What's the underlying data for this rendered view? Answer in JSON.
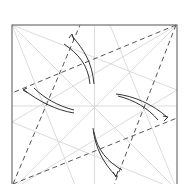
{
  "diagram": {
    "type": "origami-crease-pattern",
    "colors": {
      "background": "#ffffff",
      "border": "#707070",
      "crease": "#cfcfcf",
      "valley_fold": "#555555",
      "arrow": "#333333"
    },
    "square": {
      "x": 12,
      "y": 25,
      "size": 165
    },
    "valley_folds": [
      {
        "from": [
          176,
          25
        ],
        "to": [
          12,
          93
        ]
      },
      {
        "from": [
          176,
          25
        ],
        "to": [
          113,
          190
        ]
      },
      {
        "from": [
          13,
          184
        ],
        "to": [
          80,
          25
        ]
      },
      {
        "from": [
          13,
          184
        ],
        "to": [
          177,
          118
        ]
      }
    ],
    "arrows": [
      {
        "name": "arrow-top",
        "direction": "up-left"
      },
      {
        "name": "arrow-left",
        "direction": "left"
      },
      {
        "name": "arrow-right",
        "direction": "right-down"
      },
      {
        "name": "arrow-bottom",
        "direction": "down"
      }
    ]
  }
}
